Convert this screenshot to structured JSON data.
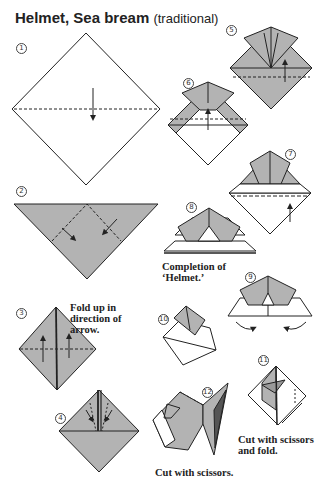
{
  "title": {
    "main": "Helmet, Sea bream",
    "sub": "(traditional)"
  },
  "colors": {
    "paper_gray": "#b3b3b3",
    "paper_white": "#ffffff",
    "line": "#222222"
  },
  "steps": [
    {
      "num": "1"
    },
    {
      "num": "2"
    },
    {
      "num": "3",
      "caption": "Fold up in\n direction of\n arrow."
    },
    {
      "num": "4"
    },
    {
      "num": "5"
    },
    {
      "num": "6"
    },
    {
      "num": "7"
    },
    {
      "num": "8",
      "caption": "Completion of\n‘Helmet.’"
    },
    {
      "num": "9"
    },
    {
      "num": "10"
    },
    {
      "num": "11",
      "caption": "Cut with scissors\n and fold."
    },
    {
      "num": "12",
      "caption": "Cut with scissors."
    }
  ]
}
